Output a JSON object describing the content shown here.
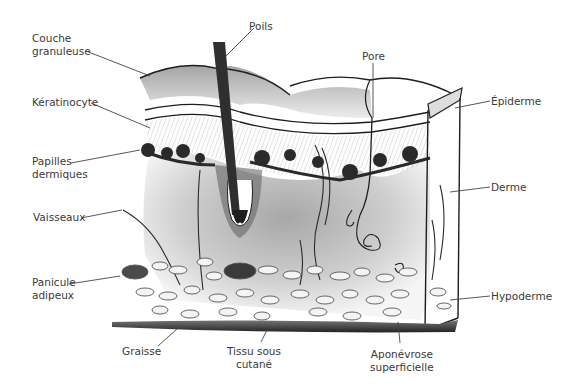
{
  "diagram": {
    "labels": {
      "couche_granuleuse": [
        "Couche",
        "granuleuse"
      ],
      "keratinocyte": [
        "Kératinocyte"
      ],
      "papilles": [
        "Papilles",
        "dermiques"
      ],
      "vaisseaux": [
        "Vaisseaux"
      ],
      "panicule": [
        "Panicule",
        "adipeux"
      ],
      "graisse": [
        "Graisse"
      ],
      "tissu": [
        "Tissu sous",
        "cutané"
      ],
      "aponevrose": [
        "Aponévrose",
        "superficielle"
      ],
      "poils": [
        "Poils"
      ],
      "pore": [
        "Pore"
      ],
      "epiderme": [
        "Épiderme"
      ],
      "derme": [
        "Derme"
      ],
      "hypoderme": [
        "Hypoderme"
      ]
    },
    "colors": {
      "ink": "#1e1e1e",
      "label_text": "#3a3a3a",
      "leader_line": "#444444",
      "background": "#ffffff"
    }
  }
}
